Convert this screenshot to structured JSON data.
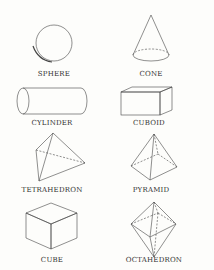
{
  "shapes": [
    {
      "name": "sphere",
      "label": "SPHERE"
    },
    {
      "name": "cone",
      "label": "CONE"
    },
    {
      "name": "cylinder",
      "label": "CYLINDER"
    },
    {
      "name": "cuboid",
      "label": "CUBOID"
    },
    {
      "name": "tetrahedron",
      "label": "TETRAHEDRON"
    },
    {
      "name": "pyramid",
      "label": "PYRAMID"
    },
    {
      "name": "cube",
      "label": "CUBE"
    },
    {
      "name": "octahedron",
      "label": "OCTAHEDRON"
    }
  ],
  "colors": {
    "line": "#444444",
    "background": "#fdfdfb"
  }
}
